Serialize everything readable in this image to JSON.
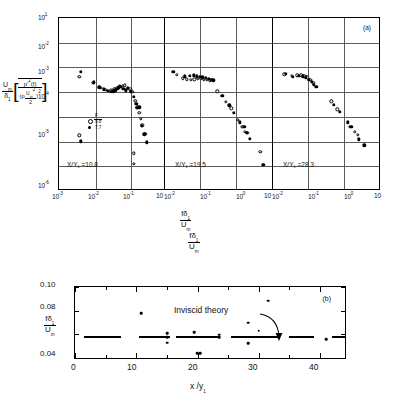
{
  "figure": {
    "panel_a_label": "(a)",
    "panel_b_label": "(b)"
  },
  "panel_a": {
    "y_ticks": [
      "10",
      "10",
      "10",
      "10",
      "10",
      "10",
      "10"
    ],
    "y_exponents": [
      "1",
      "-2",
      "-3",
      "-4",
      "-5",
      "-6",
      ""
    ],
    "y_tick_labels": [
      "10¹",
      "10⁻²",
      "10⁻³",
      "10⁻⁴",
      "10⁻⁵",
      "10⁻⁶"
    ],
    "y_axis_label_numerator": "U",
    "y_axis_label_numerator_sub": "m",
    "y_axis_label_denominator": "δ",
    "y_axis_label_denominator_sub": "1",
    "y_axis_bracket_num": "p'²(f)",
    "y_axis_bracket_den_rho": "ρ",
    "y_axis_bracket_den_u": "U",
    "y_axis_bracket_den_u_sub": "∞",
    "y_axis_bracket_den_u_sup": "2",
    "y_axis_bracket_den_two": "2",
    "y_axis_bracket_exp": "2",
    "x_axis_label_num": "fδ",
    "x_axis_label_num_sub": "1",
    "x_axis_label_den": "U",
    "x_axis_label_den_sub": "m",
    "legend": {
      "symbol_open": "○",
      "symbol_filled": "●",
      "header": "F",
      "value_open": "9.8",
      "value_filled": "7.7"
    },
    "subpanels": [
      {
        "label": "X/Y₁ =10.8",
        "x_ticks": [
          "10⁻³",
          "10⁻²",
          "10⁻¹",
          "10"
        ]
      },
      {
        "label": "X/Y₁ =19.5",
        "x_ticks": [
          "10⁻²",
          "10⁻¹",
          "10⁰",
          "10"
        ]
      },
      {
        "label": "X/Y₁ =28.3",
        "x_ticks": [
          "10⁻²",
          "10⁻¹",
          "10⁰",
          "10"
        ]
      }
    ]
  },
  "panel_b": {
    "title_num": "fδ",
    "title_num_sub": "1",
    "title_den": "U",
    "title_den_sub": "m",
    "y_tick_labels": [
      "0.10",
      "0.08",
      "0.04"
    ],
    "y_axis_label_num": "fδ",
    "y_axis_label_num_sub": "1",
    "y_axis_label_den": "U",
    "y_axis_label_den_sub": "m",
    "x_tick_labels": [
      "0",
      "10",
      "20",
      "30",
      "40"
    ],
    "x_axis_label": "x /y",
    "x_axis_label_sub": "1",
    "annotation": "Inviscid  theory"
  },
  "chart_data": [
    {
      "type": "scatter",
      "title": "(a) Wall-pressure spectra",
      "xlabel": "fδ₁ / Uₘ",
      "ylabel": "(Uₘ/δ₁)[p'²(f)/(ρU∞²/2)²]",
      "xscale": "log",
      "yscale": "log",
      "ylim": [
        1e-06,
        10
      ],
      "grid": true,
      "legend": [
        {
          "name": "F = 9.8",
          "marker": "open-circle"
        },
        {
          "name": "F = 7.7",
          "marker": "filled-circle"
        }
      ],
      "subplots": [
        {
          "name": "X/Y1 = 10.8",
          "xlim": [
            0.001,
            0.6
          ],
          "series": [
            {
              "name": "F = 9.8",
              "marker": "open-circle",
              "points": [
                [
                  0.0035,
                  0.019
                ],
                [
                  0.0082,
                  0.01
                ],
                [
                  0.013,
                  0.006
                ],
                [
                  0.018,
                  0.0048
                ],
                [
                  0.024,
                  0.0046
                ],
                [
                  0.03,
                  0.0052
                ],
                [
                  0.036,
                  0.006
                ],
                [
                  0.042,
                  0.0068
                ],
                [
                  0.05,
                  0.0075
                ],
                [
                  0.058,
                  0.0076
                ],
                [
                  0.068,
                  0.0054
                ],
                [
                  0.08,
                  0.005
                ],
                [
                  0.095,
                  0.0038
                ],
                [
                  0.11,
                  0.0015
                ],
                [
                  0.125,
                  0.00075
                ],
                [
                  0.14,
                  0.0004
                ],
                [
                  0.155,
                  0.00022
                ],
                [
                  0.17,
                  0.00011
                ],
                [
                  0.2,
                  4.5e-05
                ],
                [
                  0.0035,
                  3.8e-05
                ],
                [
                  0.098,
                  5.5e-06
                ],
                [
                  0.098,
                  1.8e-06
                ]
              ]
            },
            {
              "name": "F = 7.7",
              "marker": "filled-circle",
              "points": [
                [
                  0.0038,
                  0.033
                ],
                [
                  0.0085,
                  0.0105
                ],
                [
                  0.012,
                  0.0062
                ],
                [
                  0.016,
                  0.005
                ],
                [
                  0.02,
                  0.0042
                ],
                [
                  0.024,
                  0.0039
                ],
                [
                  0.028,
                  0.004
                ],
                [
                  0.032,
                  0.0045
                ],
                [
                  0.036,
                  0.0054
                ],
                [
                  0.04,
                  0.0062
                ],
                [
                  0.045,
                  0.0066
                ],
                [
                  0.052,
                  0.0052
                ],
                [
                  0.06,
                  0.0046
                ],
                [
                  0.07,
                  0.006
                ],
                [
                  0.082,
                  0.004
                ],
                [
                  0.1,
                  0.0022
                ],
                [
                  0.115,
                  0.0011
                ],
                [
                  0.125,
                  0.0007
                ],
                [
                  0.14,
                  0.00075
                ],
                [
                  0.16,
                  0.0001
                ],
                [
                  0.19,
                  4.2e-05
                ],
                [
                  0.22,
                  1.8e-05
                ],
                [
                  0.0038,
                  2e-05
                ]
              ]
            }
          ]
        },
        {
          "name": "X/Y1 = 19.5",
          "xlim": [
            0.006,
            3
          ],
          "series": [
            {
              "name": "F = 9.8",
              "marker": "open-circle",
              "points": [
                [
                  0.011,
                  0.024
                ],
                [
                  0.016,
                  0.016
                ],
                [
                  0.02,
                  0.0145
                ],
                [
                  0.025,
                  0.014
                ],
                [
                  0.031,
                  0.0145
                ],
                [
                  0.038,
                  0.015
                ],
                [
                  0.046,
                  0.015
                ],
                [
                  0.055,
                  0.014
                ],
                [
                  0.065,
                  0.014
                ],
                [
                  0.078,
                  0.013
                ],
                [
                  0.12,
                  0.004
                ],
                [
                  0.2,
                  0.0013
                ],
                [
                  0.27,
                  0.00065
                ],
                [
                  0.4,
                  0.0002
                ],
                [
                  0.52,
                  9e-05
                ],
                [
                  0.6,
                  5.5e-05
                ],
                [
                  0.7,
                  4.8e-05
                ],
                [
                  1.5,
                  6.5e-06
                ]
              ]
            },
            {
              "name": "F = 7.7",
              "marker": "filled-circle",
              "points": [
                [
                  0.009,
                  0.033
                ],
                [
                  0.018,
                  0.02
                ],
                [
                  0.024,
                  0.021
                ],
                [
                  0.03,
                  0.022
                ],
                [
                  0.036,
                  0.02
                ],
                [
                  0.044,
                  0.019
                ],
                [
                  0.052,
                  0.018
                ],
                [
                  0.062,
                  0.017
                ],
                [
                  0.072,
                  0.015
                ],
                [
                  0.085,
                  0.0135
                ],
                [
                  0.095,
                  0.013
                ],
                [
                  0.16,
                  0.0025
                ],
                [
                  0.24,
                  0.0009
                ],
                [
                  0.32,
                  0.0004
                ],
                [
                  0.45,
                  0.00015
                ],
                [
                  0.58,
                  9.5e-05
                ],
                [
                  0.68,
                  5e-05
                ],
                [
                  0.8,
                  2.6e-05
                ],
                [
                  1.8,
                  1.6e-06
                ]
              ]
            }
          ]
        },
        {
          "name": "X/Y1 = 28.3",
          "xlim": [
            0.006,
            3
          ],
          "series": [
            {
              "name": "F = 9.8",
              "marker": "open-circle",
              "points": [
                [
                  0.011,
                  0.025
                ],
                [
                  0.017,
                  0.021
                ],
                [
                  0.024,
                  0.022
                ],
                [
                  0.03,
                  0.022
                ],
                [
                  0.036,
                  0.02
                ],
                [
                  0.043,
                  0.018
                ],
                [
                  0.052,
                  0.014
                ],
                [
                  0.062,
                  0.01
                ],
                [
                  0.18,
                  0.0014
                ],
                [
                  0.26,
                  0.0006
                ],
                [
                  0.55,
                  9e-05
                ],
                [
                  0.75,
                  5.5e-05
                ],
                [
                  0.9,
                  4e-05
                ]
              ]
            },
            {
              "name": "F = 7.7",
              "marker": "filled-circle",
              "points": [
                [
                  0.012,
                  0.026
                ],
                [
                  0.018,
                  0.019
                ],
                [
                  0.026,
                  0.021
                ],
                [
                  0.033,
                  0.02
                ],
                [
                  0.04,
                  0.018
                ],
                [
                  0.048,
                  0.014
                ],
                [
                  0.056,
                  0.011
                ],
                [
                  0.065,
                  0.008
                ],
                [
                  0.075,
                  0.0065
                ],
                [
                  0.21,
                  0.00095
                ],
                [
                  0.3,
                  0.00045
                ],
                [
                  0.48,
                  0.00015
                ],
                [
                  0.6,
                  9e-05
                ],
                [
                  0.95,
                  2.4e-05
                ],
                [
                  1.3,
                  1.3e-05
                ]
              ]
            }
          ]
        }
      ]
    },
    {
      "type": "scatter",
      "title": "(b) Peak Strouhal number",
      "xlabel": "x /y₁",
      "ylabel": "fδ₁ / Uₘ",
      "xlim": [
        0,
        44
      ],
      "ylim": [
        0.04,
        0.1
      ],
      "xticks": [
        0,
        10,
        20,
        30,
        40
      ],
      "yticks": [
        0.04,
        0.08,
        0.1
      ],
      "grid": false,
      "annotations": [
        {
          "text": "Inviscid  theory",
          "x": 26,
          "y": 0.082
        }
      ],
      "series": [
        {
          "name": "measured",
          "marker": "filled-circle",
          "points": [
            [
              10.8,
              0.0775
            ],
            [
              15.0,
              0.0605
            ],
            [
              15.0,
              0.0525
            ],
            [
              15.0,
              0.0575
            ],
            [
              19.5,
              0.0615
            ],
            [
              23.5,
              0.0595
            ],
            [
              23.5,
              0.0575
            ],
            [
              28.3,
              0.0695
            ],
            [
              28.3,
              0.0522
            ],
            [
              30.0,
              0.063
            ],
            [
              31.5,
              0.0885
            ],
            [
              41.0,
              0.0555
            ],
            [
              19.9,
              0.0435
            ],
            [
              20.4,
              0.0435
            ]
          ]
        },
        {
          "name": "Inviscid theory",
          "type": "line",
          "style": "segments",
          "segments": [
            [
              1.5,
              7.5
            ],
            [
              10.5,
              15.5
            ],
            [
              16.5,
              23.5
            ],
            [
              25.5,
              33.5
            ],
            [
              35.0,
              39.0
            ],
            [
              42.0,
              44.0
            ]
          ],
          "value": 0.058
        }
      ]
    }
  ]
}
